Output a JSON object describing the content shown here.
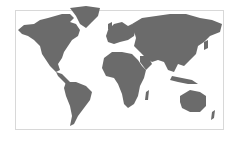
{
  "map": {
    "title": "World map",
    "land_color": "#6b6b6b",
    "ocean_color": "#ffffff",
    "border_color": "#d8d8d8",
    "regions": [
      {
        "name": "north-america",
        "d": "M18,30 L24,25 L34,24 L40,20 L48,18 L55,16 L62,14 L70,14 L74,18 L70,22 L76,24 L80,30 L78,36 L72,40 L68,46 L64,52 L62,58 L58,64 L60,70 L56,72 L50,66 L46,60 L42,54 L40,46 L34,40 L28,36 L22,34 Z"
      },
      {
        "name": "greenland",
        "d": "M70,8 L86,6 L100,8 L98,16 L92,22 L86,28 L80,24 L76,16 Z"
      },
      {
        "name": "central-america",
        "d": "M56,72 L62,74 L66,78 L70,82 L66,84 L62,80 L58,76 Z"
      },
      {
        "name": "south-america",
        "d": "M66,82 L76,82 L86,86 L92,92 L90,100 L84,108 L78,116 L74,124 L70,126 L72,116 L70,106 L66,96 L64,88 Z"
      },
      {
        "name": "europe",
        "d": "M108,30 L114,24 L122,22 L128,26 L132,24 L136,28 L134,36 L128,40 L120,42 L114,44 L108,42 L106,36 Z"
      },
      {
        "name": "uk",
        "d": "M108,24 L112,22 L112,28 L108,30 Z"
      },
      {
        "name": "africa",
        "d": "M104,58 L112,52 L122,52 L132,54 L138,60 L142,66 L146,70 L144,78 L140,86 L138,96 L134,104 L128,108 L124,104 L122,94 L118,84 L114,78 L106,76 L102,68 Z"
      },
      {
        "name": "madagascar",
        "d": "M146,92 L149,90 L148,100 L145,100 Z"
      },
      {
        "name": "asia",
        "d": "M132,24 L142,18 L156,16 L170,14 L186,14 L200,18 L212,20 L222,24 L220,32 L210,36 L204,42 L198,46 L196,54 L190,60 L184,66 L178,64 L174,72 L168,70 L164,62 L158,60 L152,62 L146,58 L140,52 L134,46 L136,38 Z"
      },
      {
        "name": "arabia",
        "d": "M140,56 L148,56 L152,64 L146,70 L140,62 Z"
      },
      {
        "name": "japan",
        "d": "M204,42 L208,40 L208,48 L204,50 Z"
      },
      {
        "name": "indonesia",
        "d": "M172,76 L182,78 L192,80 L198,84 L188,84 L178,82 L170,80 Z"
      },
      {
        "name": "australia",
        "d": "M180,96 L190,90 L200,92 L206,96 L206,106 L200,112 L190,112 L182,108 L180,102 Z"
      },
      {
        "name": "new-zealand",
        "d": "M212,112 L215,110 L214,118 L211,120 Z"
      }
    ]
  }
}
